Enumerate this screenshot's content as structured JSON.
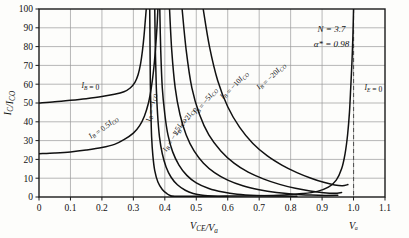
{
  "chart_data": {
    "type": "line",
    "title": "",
    "xlabel": "V_CE / V_a",
    "ylabel": "I_C / I_CO",
    "xlim": [
      0,
      1.1
    ],
    "ylim": [
      0,
      100
    ],
    "xticks": [
      "0",
      "0.1",
      "0.2",
      "0.3",
      "0.4",
      "0.5",
      "0.6",
      "0.7",
      "0.8",
      "0.9",
      "1.0",
      "1.1"
    ],
    "xtick_values": [
      0,
      0.1,
      0.2,
      0.3,
      0.4,
      0.5,
      0.6,
      0.7,
      0.8,
      0.9,
      1.0,
      1.1
    ],
    "yticks": [
      "0",
      "10",
      "20",
      "30",
      "40",
      "50",
      "60",
      "70",
      "80",
      "90",
      "100"
    ],
    "ytick_values": [
      0,
      10,
      20,
      30,
      40,
      50,
      60,
      70,
      80,
      90,
      100
    ],
    "grid": true,
    "legend_position": "inline-curve-labels",
    "annotations": [
      {
        "name": "N",
        "text": "N = 3.7",
        "x": 0.93,
        "y": 88
      },
      {
        "name": "alpha-star",
        "text": "α* = 0.98",
        "x": 0.93,
        "y": 80
      },
      {
        "name": "Va-marker",
        "text": "Vₐ",
        "x": 1.0,
        "y": -14
      }
    ],
    "vertical_dashed_line": {
      "x": 1.0,
      "label": "Vₐ"
    },
    "series": [
      {
        "name": "IB = 0",
        "label": "I_B = 0",
        "label_pos": {
          "x": 0.135,
          "y": 58
        },
        "label_rotation": 0,
        "points": [
          [
            0,
            50
          ],
          [
            0.05,
            50.6
          ],
          [
            0.1,
            51.4
          ],
          [
            0.15,
            52.3
          ],
          [
            0.2,
            53.4
          ],
          [
            0.24,
            54.6
          ],
          [
            0.27,
            56
          ],
          [
            0.29,
            58
          ],
          [
            0.305,
            61
          ],
          [
            0.315,
            65
          ],
          [
            0.323,
            71
          ],
          [
            0.329,
            78
          ],
          [
            0.334,
            86
          ],
          [
            0.338,
            94
          ],
          [
            0.341,
            100
          ]
        ]
      },
      {
        "name": "IB = 0.5 ICO",
        "label": "I_B = 0.5 I_CO",
        "label_pos": {
          "x": 0.165,
          "y": 31
        },
        "label_rotation": -38,
        "points": [
          [
            0,
            23
          ],
          [
            0.05,
            23.4
          ],
          [
            0.1,
            24
          ],
          [
            0.15,
            25
          ],
          [
            0.2,
            26.3
          ],
          [
            0.24,
            28
          ],
          [
            0.27,
            30.5
          ],
          [
            0.3,
            34
          ],
          [
            0.32,
            38
          ],
          [
            0.335,
            43
          ],
          [
            0.348,
            50
          ],
          [
            0.357,
            58
          ],
          [
            0.364,
            67
          ],
          [
            0.37,
            78
          ],
          [
            0.375,
            90
          ],
          [
            0.378,
            100
          ]
        ]
      },
      {
        "name": "IB = -ICO",
        "label": "I_B = -I_CO",
        "label_pos": {
          "x": 0.355,
          "y": 40
        },
        "label_rotation": -83,
        "points": [
          [
            0.352,
            100
          ],
          [
            0.353,
            80
          ],
          [
            0.354,
            60
          ],
          [
            0.356,
            44
          ],
          [
            0.358,
            32
          ],
          [
            0.362,
            22
          ],
          [
            0.368,
            14
          ],
          [
            0.378,
            8
          ],
          [
            0.392,
            4
          ],
          [
            0.408,
            1.6
          ],
          [
            0.42,
            0.6
          ],
          [
            0.43,
            0.2
          ]
        ]
      },
      {
        "name": "IB = -1.5 ICO",
        "label": "I_B = -1.5 I_CO",
        "label_pos": {
          "x": 0.405,
          "y": 24
        },
        "label_rotation": -62,
        "points": [
          [
            0.368,
            100
          ],
          [
            0.37,
            78
          ],
          [
            0.373,
            58
          ],
          [
            0.377,
            44
          ],
          [
            0.383,
            32
          ],
          [
            0.392,
            23
          ],
          [
            0.404,
            16
          ],
          [
            0.42,
            10.5
          ],
          [
            0.44,
            6.5
          ],
          [
            0.465,
            3.6
          ],
          [
            0.49,
            1.9
          ],
          [
            0.52,
            0.9
          ],
          [
            0.56,
            0.4
          ],
          [
            0.6,
            0.25
          ]
        ]
      },
      {
        "name": "IB = -2 ICO",
        "label": "I_B = -2 I_CO",
        "label_pos": {
          "x": 0.44,
          "y": 33
        },
        "label_rotation": -58,
        "points": [
          [
            0.384,
            100
          ],
          [
            0.387,
            78
          ],
          [
            0.392,
            58
          ],
          [
            0.4,
            44
          ],
          [
            0.41,
            33
          ],
          [
            0.425,
            24
          ],
          [
            0.445,
            17
          ],
          [
            0.47,
            11.5
          ],
          [
            0.5,
            7.5
          ],
          [
            0.54,
            4.5
          ],
          [
            0.585,
            2.6
          ],
          [
            0.63,
            1.5
          ],
          [
            0.69,
            0.8
          ],
          [
            0.75,
            0.5
          ],
          [
            0.82,
            0.45
          ]
        ]
      },
      {
        "name": "IB = -5 ICO",
        "label": "I_B = -5 I_CO",
        "label_pos": {
          "x": 0.5,
          "y": 44
        },
        "label_rotation": -52,
        "points": [
          [
            0.415,
            100
          ],
          [
            0.422,
            78
          ],
          [
            0.433,
            58
          ],
          [
            0.448,
            44
          ],
          [
            0.468,
            33
          ],
          [
            0.493,
            24.5
          ],
          [
            0.523,
            18
          ],
          [
            0.558,
            13
          ],
          [
            0.6,
            9
          ],
          [
            0.648,
            6
          ],
          [
            0.7,
            3.9
          ],
          [
            0.755,
            2.4
          ],
          [
            0.81,
            1.5
          ],
          [
            0.865,
            1.0
          ],
          [
            0.91,
            0.8
          ],
          [
            0.95,
            0.9
          ]
        ]
      },
      {
        "name": "IB = -10 ICO",
        "label": "I_B = -10 I_CO",
        "label_pos": {
          "x": 0.585,
          "y": 52
        },
        "label_rotation": -48,
        "points": [
          [
            0.455,
            100
          ],
          [
            0.468,
            78
          ],
          [
            0.486,
            58
          ],
          [
            0.51,
            44
          ],
          [
            0.54,
            33
          ],
          [
            0.578,
            24.5
          ],
          [
            0.62,
            18
          ],
          [
            0.665,
            13.2
          ],
          [
            0.715,
            9.5
          ],
          [
            0.765,
            6.7
          ],
          [
            0.815,
            4.6
          ],
          [
            0.862,
            3.2
          ],
          [
            0.905,
            2.3
          ],
          [
            0.94,
            2.0
          ],
          [
            0.962,
            2.4
          ]
        ]
      },
      {
        "name": "IB = -20 ICO",
        "label": "I_B = -20 I_CO",
        "label_pos": {
          "x": 0.7,
          "y": 57
        },
        "label_rotation": -45,
        "points": [
          [
            0.522,
            100
          ],
          [
            0.542,
            80
          ],
          [
            0.568,
            62
          ],
          [
            0.6,
            48
          ],
          [
            0.638,
            37
          ],
          [
            0.68,
            28.5
          ],
          [
            0.725,
            22
          ],
          [
            0.772,
            17
          ],
          [
            0.82,
            13
          ],
          [
            0.865,
            10
          ],
          [
            0.905,
            7.8
          ],
          [
            0.94,
            6.4
          ],
          [
            0.965,
            6.0
          ],
          [
            0.982,
            6.6
          ]
        ]
      },
      {
        "name": "IE = 0",
        "label": "I_E = 0",
        "label_pos": {
          "x": 1.035,
          "y": 57
        },
        "label_rotation": 0,
        "points": [
          [
            0.42,
            0.35
          ],
          [
            0.5,
            0.4
          ],
          [
            0.6,
            0.5
          ],
          [
            0.7,
            0.7
          ],
          [
            0.78,
            1.1
          ],
          [
            0.84,
            1.8
          ],
          [
            0.885,
            3
          ],
          [
            0.92,
            5.2
          ],
          [
            0.945,
            9
          ],
          [
            0.962,
            15
          ],
          [
            0.973,
            23
          ],
          [
            0.981,
            33
          ],
          [
            0.987,
            45
          ],
          [
            0.991,
            58
          ],
          [
            0.995,
            72
          ],
          [
            0.998,
            86
          ],
          [
            1.0,
            100
          ]
        ]
      }
    ]
  },
  "axis_titles": {
    "x": {
      "main": "V",
      "sub1": "CE",
      "slash": "/V",
      "sub2": "a"
    },
    "y": {
      "main": "I",
      "sub1": "C",
      "slash": "/I",
      "sub2": "CO"
    }
  },
  "curve_labels": [
    {
      "id": "ib-0",
      "parts": [
        {
          "t": "I",
          "i": true
        },
        {
          "t": "B",
          "sub": true
        },
        {
          "t": " = 0"
        }
      ]
    },
    {
      "id": "ib-05ico",
      "parts": [
        {
          "t": "I",
          "i": true
        },
        {
          "t": "B",
          "sub": true
        },
        {
          "t": " = 0.5"
        },
        {
          "t": "I",
          "i": true
        },
        {
          "t": "CO",
          "sub": true
        }
      ]
    },
    {
      "id": "ib-neg-ico",
      "parts": [
        {
          "t": "I",
          "i": true
        },
        {
          "t": "B",
          "sub": true
        },
        {
          "t": " = −"
        },
        {
          "t": "I",
          "i": true
        },
        {
          "t": "CO",
          "sub": true
        }
      ]
    },
    {
      "id": "ib-neg-15ico",
      "parts": [
        {
          "t": "I",
          "i": true
        },
        {
          "t": "B",
          "sub": true
        },
        {
          "t": " = −1.5"
        },
        {
          "t": "I",
          "i": true
        },
        {
          "t": "CO",
          "sub": true
        }
      ]
    },
    {
      "id": "ib-neg-2ico",
      "parts": [
        {
          "t": "I",
          "i": true
        },
        {
          "t": "B",
          "sub": true
        },
        {
          "t": " = −2"
        },
        {
          "t": "I",
          "i": true
        },
        {
          "t": "CO",
          "sub": true
        }
      ]
    },
    {
      "id": "ib-neg-5ico",
      "parts": [
        {
          "t": "I",
          "i": true
        },
        {
          "t": "B",
          "sub": true
        },
        {
          "t": " = −5"
        },
        {
          "t": "I",
          "i": true
        },
        {
          "t": "CO",
          "sub": true
        }
      ]
    },
    {
      "id": "ib-neg-10ico",
      "parts": [
        {
          "t": "I",
          "i": true
        },
        {
          "t": "B",
          "sub": true
        },
        {
          "t": " = −10"
        },
        {
          "t": "I",
          "i": true
        },
        {
          "t": "CO",
          "sub": true
        }
      ]
    },
    {
      "id": "ib-neg-20ico",
      "parts": [
        {
          "t": "I",
          "i": true
        },
        {
          "t": "B",
          "sub": true
        },
        {
          "t": " = −20"
        },
        {
          "t": "I",
          "i": true
        },
        {
          "t": "CO",
          "sub": true
        }
      ]
    },
    {
      "id": "ie-0",
      "parts": [
        {
          "t": "I",
          "i": true
        },
        {
          "t": "E",
          "sub": true
        },
        {
          "t": " = 0"
        }
      ]
    }
  ],
  "colors": {
    "background": "#fdfdfb",
    "grid": "#9a9a9a",
    "axis": "#1a1a1a",
    "curve": "#111111",
    "dashed": "#555555",
    "text": "#111111"
  }
}
